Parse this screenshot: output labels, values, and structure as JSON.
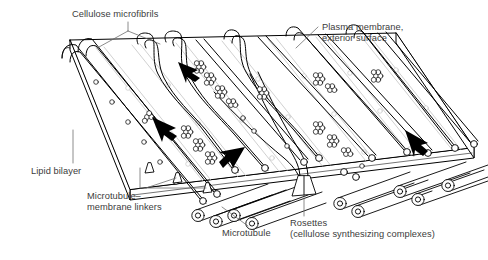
{
  "figure": {
    "kind": "biology-diagram",
    "background_color": "#ffffff",
    "ink_color": "#000000",
    "text_color": "#3c3c3c",
    "faint_ink_color": "#b8b8b8"
  },
  "labels": {
    "cellulose_microfibrils": "Cellulose microfibrils",
    "plasma_membrane": "Plasma membrane,\nexterior surface",
    "lipid_bilayer": "Lipid bilayer",
    "microtubule_membrane_linkers": "Microtubule–\nmembrane linkers",
    "microtubule": "Microtubule",
    "rosettes": "Rosettes\n(cellulose synthesizing complexes)"
  },
  "structures": {
    "membrane_slab": "plasma-membrane-slab",
    "microfibril_count": 14,
    "rosette_cluster_count": 8,
    "arrow_count": 4,
    "microtubule_count": 9,
    "linker_count": 4
  }
}
